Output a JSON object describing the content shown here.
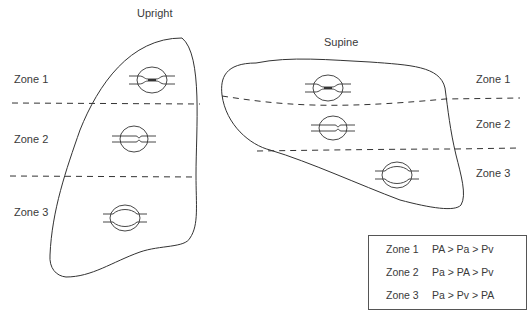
{
  "diagram": {
    "panels": [
      {
        "title": "Upright",
        "zone_labels": [
          "Zone 1",
          "Zone 2",
          "Zone 3"
        ]
      },
      {
        "title": "Supine",
        "zone_labels": [
          "Zone 1",
          "Zone 2",
          "Zone 3"
        ]
      }
    ],
    "legend": {
      "rows": [
        {
          "zone": "Zone 1",
          "relation": "PA > Pa > Pv"
        },
        {
          "zone": "Zone 2",
          "relation": "Pa > PA > Pv"
        },
        {
          "zone": "Zone 3",
          "relation": "Pa > Pv > PA"
        }
      ]
    },
    "colors": {
      "stroke": "#333333",
      "background": "#ffffff",
      "text": "#3a3a3a"
    }
  }
}
